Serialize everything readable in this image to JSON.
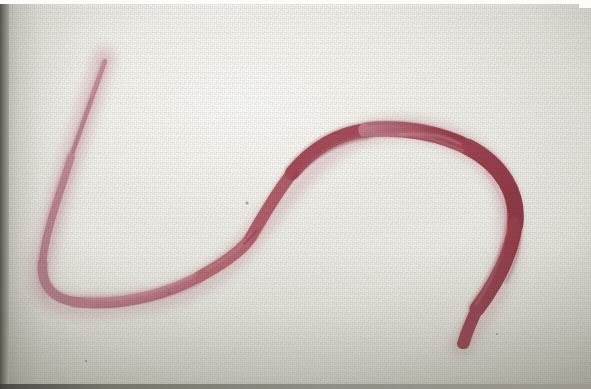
{
  "image": {
    "domain": "natural-image",
    "subject": "stained helminth worm specimen",
    "description": "Close-up photograph of a long, slender red-stained parasitic worm (nematode/helminth) laid out on a pale off-white woven background, photographed against a lightly textured fabric or paper surface.",
    "orientation": "landscape",
    "width_px": 591,
    "height_px": 389,
    "medium": "photographic print / scanned photograph",
    "has_text": false,
    "has_scale_bar": false,
    "has_label": false
  },
  "background": {
    "name": "pale woven backdrop",
    "base_color": "#f2f1ec",
    "highlight_color": "#fdfdfb",
    "shadow_color": "#8d8a80",
    "corner_color": "#9a968d",
    "texture": "fine woven grid / screen texture",
    "vignette": "strong at left, bottom and right corners"
  },
  "borders": {
    "top_letterbox_color": "#fbfbfa",
    "left_edge_color": "#4e4c47",
    "bottom_edge_color": "#3f3d39",
    "corner_sliver_color": "#fcfcfb"
  },
  "specimen": {
    "name": "worm-specimen",
    "shape": "elongated S / question-mark curve",
    "anterior_tip": "thin tapered tip at upper left",
    "posterior_tip": "blunt rounded tip at lower right",
    "colors": {
      "deep_red": "#9c3f4f",
      "mid_red": "#b5555f",
      "light_pink": "#c9919c",
      "pale_pink": "#d8a9b2",
      "highlight": "#e3bcc2",
      "shadow": "#7d2f3f"
    },
    "segments": [
      {
        "id": "anterior-tail",
        "label": "thin tapered anterior tail (upper left)",
        "color": "#c08c99",
        "thickness_px": 5,
        "path": "M 104 58 C 96 80, 84 112, 70 152"
      },
      {
        "id": "upper-left-descender",
        "label": "descending left limb",
        "color": "#bd8593",
        "thickness_px": 9,
        "path": "M 70 152 C 58 190, 44 228, 42 258"
      },
      {
        "id": "left-u-bend",
        "label": "U-turn at lower left",
        "color": "#bc7f8f",
        "thickness_px": 11,
        "path": "M 42 258 C 41 280, 52 294, 76 297"
      },
      {
        "id": "lower-horizontal",
        "label": "lower horizontal run sweeping right",
        "color": "#bf7d8d",
        "thickness_px": 12,
        "path": "M 76 297 C 118 300, 160 292, 200 272"
      },
      {
        "id": "mid-ascender",
        "label": "rising mid-body with kink",
        "color": "#b96875",
        "thickness_px": 13,
        "path": "M 200 272 C 228 256, 244 244, 252 232 C 262 216, 276 188, 292 168"
      },
      {
        "id": "upper-sweep",
        "label": "upper body sweeping to the right crest",
        "color": "#a8495a",
        "thickness_px": 16,
        "path": "M 292 168 C 312 144, 334 130, 366 126 C 400 122, 440 128, 470 144"
      },
      {
        "id": "right-hook-outer",
        "label": "right hook descending",
        "color": "#9c3f4f",
        "thickness_px": 17,
        "path": "M 470 144 C 502 160, 518 188, 514 220 C 510 252, 494 280, 476 304"
      },
      {
        "id": "posterior-tip",
        "label": "blunt rounded posterior tip curving left-down",
        "color": "#9a3d4d",
        "thickness_px": 13,
        "path": "M 476 304 C 470 318, 466 330, 464 338"
      }
    ],
    "features": [
      {
        "id": "kink-notch",
        "label": "notch / constriction in mid-body",
        "x": 249,
        "y": 236
      },
      {
        "id": "internal-highlight-crest",
        "label": "pale internal highlight along upper crest",
        "x": 400,
        "y": 133
      },
      {
        "id": "internal-highlight-hook",
        "label": "pale internal highlight along hook",
        "x": 498,
        "y": 230
      },
      {
        "id": "dark-speck",
        "label": "small dark speck on backdrop",
        "x": 247,
        "y": 199
      },
      {
        "id": "dark-speck-2",
        "label": "small dark speck near lower body",
        "x": 169,
        "y": 289
      }
    ]
  }
}
